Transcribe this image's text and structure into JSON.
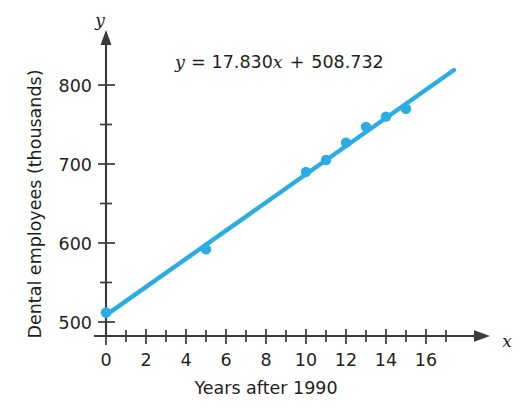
{
  "chart_data": {
    "type": "scatter",
    "title": "",
    "subtitle": "",
    "xlabel": "Years after 1990",
    "ylabel": "Dental employees (thousands)",
    "x_axis_variable": "x",
    "y_axis_variable": "y",
    "xlim": [
      0,
      17.5
    ],
    "ylim": [
      500,
      820
    ],
    "grid": false,
    "legend": "none",
    "annotation": "y = 17.830x + 508.732",
    "annotation_parts": {
      "y": "y",
      "equals": "=",
      "slope": "17.830",
      "x": "x",
      "plus": "+",
      "intercept": "508.732"
    },
    "regression": {
      "slope": 17.83,
      "intercept": 508.732,
      "x_start": 0,
      "x_end": 17.4,
      "color": "#2bade3"
    },
    "x_tick_labels": [
      "0",
      "2",
      "4",
      "6",
      "8",
      "10",
      "12",
      "14",
      "16"
    ],
    "x_major_ticks": [
      0,
      2,
      4,
      6,
      8,
      10,
      12,
      14,
      16
    ],
    "x_minor_ticks": [
      1,
      3,
      5,
      7,
      9,
      11,
      13,
      15,
      17
    ],
    "y_tick_labels": [
      "500",
      "600",
      "700",
      "800"
    ],
    "y_major_ticks": [
      500,
      600,
      700,
      800
    ],
    "y_minor_ticks": [
      550,
      650,
      750
    ],
    "points": [
      {
        "x": 0,
        "y": 512
      },
      {
        "x": 5,
        "y": 592
      },
      {
        "x": 10,
        "y": 690
      },
      {
        "x": 11,
        "y": 705
      },
      {
        "x": 12,
        "y": 727
      },
      {
        "x": 13,
        "y": 747
      },
      {
        "x": 14,
        "y": 760
      },
      {
        "x": 15,
        "y": 770
      }
    ],
    "series": [
      {
        "name": "Dental employees",
        "x": [
          0,
          5,
          10,
          11,
          12,
          13,
          14,
          15
        ],
        "values": [
          512,
          592,
          690,
          705,
          727,
          747,
          760,
          770
        ],
        "marker_color": "#2bade3"
      }
    ],
    "colors": {
      "data": "#2bade3",
      "axis": "#3a3a3a",
      "text": "#231f20",
      "background": "#ffffff"
    }
  }
}
